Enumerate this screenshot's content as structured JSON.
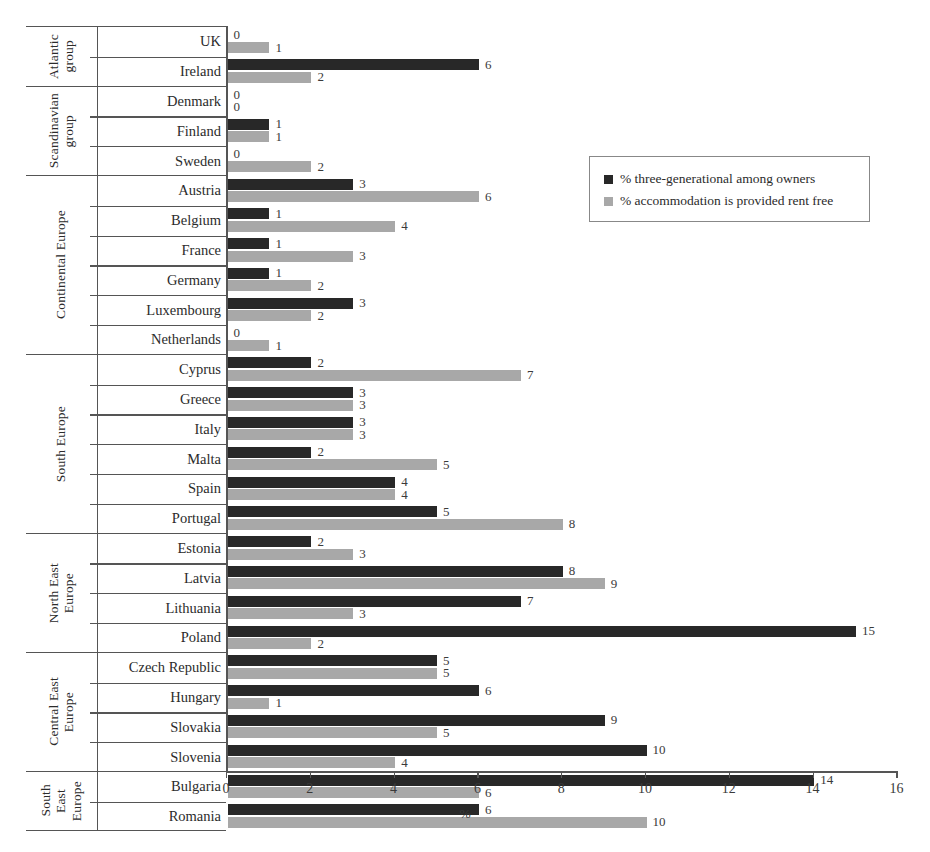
{
  "chart_data": {
    "type": "bar",
    "orientation": "horizontal",
    "title": "",
    "xlabel": "%",
    "ylabel": "",
    "xlim": [
      0,
      16
    ],
    "xticks": [
      0,
      2,
      4,
      6,
      8,
      10,
      12,
      14,
      16
    ],
    "grid": false,
    "legend_position": "upper right",
    "series": [
      {
        "name": "% three-generational among owners",
        "color": "#282828",
        "values": [
          0,
          6,
          0,
          1,
          0,
          3,
          1,
          1,
          1,
          3,
          0,
          2,
          3,
          3,
          2,
          4,
          5,
          2,
          8,
          7,
          15,
          5,
          6,
          9,
          10,
          14,
          6
        ]
      },
      {
        "name": "% accommodation is provided rent free",
        "color": "#a8a8a8",
        "values": [
          1,
          2,
          0,
          1,
          2,
          6,
          4,
          3,
          2,
          2,
          1,
          7,
          3,
          3,
          5,
          4,
          8,
          3,
          9,
          3,
          2,
          5,
          1,
          5,
          4,
          6,
          10
        ]
      }
    ],
    "categories": [
      "UK",
      "Ireland",
      "Denmark",
      "Finland",
      "Sweden",
      "Austria",
      "Belgium",
      "France",
      "Germany",
      "Luxembourg",
      "Netherlands",
      "Cyprus",
      "Greece",
      "Italy",
      "Malta",
      "Spain",
      "Portugal",
      "Estonia",
      "Latvia",
      "Lithuania",
      "Poland",
      "Czech Republic",
      "Hungary",
      "Slovakia",
      "Slovenia",
      "Bulgaria",
      "Romania"
    ],
    "groups": [
      {
        "label_lines": [
          "Atlantic",
          "group"
        ],
        "countries": [
          {
            "name": "UK",
            "dark": 0,
            "light": 1
          },
          {
            "name": "Ireland",
            "dark": 6,
            "light": 2
          }
        ]
      },
      {
        "label_lines": [
          "Scandinavian",
          "group"
        ],
        "countries": [
          {
            "name": "Denmark",
            "dark": 0,
            "light": 0
          },
          {
            "name": "Finland",
            "dark": 1,
            "light": 1
          },
          {
            "name": "Sweden",
            "dark": 0,
            "light": 2
          }
        ]
      },
      {
        "label_lines": [
          "Continental Europe"
        ],
        "countries": [
          {
            "name": "Austria",
            "dark": 3,
            "light": 6
          },
          {
            "name": "Belgium",
            "dark": 1,
            "light": 4
          },
          {
            "name": "France",
            "dark": 1,
            "light": 3
          },
          {
            "name": "Germany",
            "dark": 1,
            "light": 2
          },
          {
            "name": "Luxembourg",
            "dark": 3,
            "light": 2
          },
          {
            "name": "Netherlands",
            "dark": 0,
            "light": 1
          }
        ]
      },
      {
        "label_lines": [
          "South Europe"
        ],
        "countries": [
          {
            "name": "Cyprus",
            "dark": 2,
            "light": 7
          },
          {
            "name": "Greece",
            "dark": 3,
            "light": 3
          },
          {
            "name": "Italy",
            "dark": 3,
            "light": 3
          },
          {
            "name": "Malta",
            "dark": 2,
            "light": 5
          },
          {
            "name": "Spain",
            "dark": 4,
            "light": 4
          },
          {
            "name": "Portugal",
            "dark": 5,
            "light": 8
          }
        ]
      },
      {
        "label_lines": [
          "North East",
          "Europe"
        ],
        "countries": [
          {
            "name": "Estonia",
            "dark": 2,
            "light": 3
          },
          {
            "name": "Latvia",
            "dark": 8,
            "light": 9
          },
          {
            "name": "Lithuania",
            "dark": 7,
            "light": 3
          },
          {
            "name": "Poland",
            "dark": 15,
            "light": 2
          }
        ]
      },
      {
        "label_lines": [
          "Central East",
          "Europe"
        ],
        "countries": [
          {
            "name": "Czech Republic",
            "dark": 5,
            "light": 5
          },
          {
            "name": "Hungary",
            "dark": 6,
            "light": 1
          },
          {
            "name": "Slovakia",
            "dark": 9,
            "light": 5
          },
          {
            "name": "Slovenia",
            "dark": 10,
            "light": 4
          }
        ]
      },
      {
        "label_lines": [
          "South",
          "East",
          "Europe"
        ],
        "countries": [
          {
            "name": "Bulgaria",
            "dark": 14,
            "light": 6
          },
          {
            "name": "Romania",
            "dark": 6,
            "light": 10
          }
        ]
      }
    ]
  },
  "legend": {
    "items": [
      {
        "label": "% three-generational among owners",
        "swatch": "dark"
      },
      {
        "label": "% accommodation is provided rent free",
        "swatch": "light"
      }
    ]
  },
  "axis": {
    "x_title": "%",
    "tick_labels": [
      "0",
      "2",
      "4",
      "6",
      "8",
      "10",
      "12",
      "14",
      "16"
    ]
  },
  "colors": {
    "dark_series": "#282828",
    "light_series": "#a8a8a8",
    "rule": "#555555",
    "text": "#2b2b2b"
  }
}
